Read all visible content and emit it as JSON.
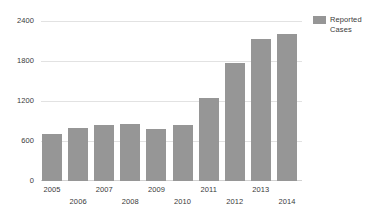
{
  "chart_data": {
    "type": "bar",
    "title": "",
    "xlabel": "",
    "ylabel": "",
    "categories": [
      "2005",
      "2006",
      "2007",
      "2008",
      "2009",
      "2010",
      "2011",
      "2012",
      "2013",
      "2014"
    ],
    "values": [
      700,
      790,
      840,
      860,
      780,
      840,
      1240,
      1770,
      2130,
      2200
    ],
    "series": [
      {
        "name": "Reported Cases",
        "values": [
          700,
          790,
          840,
          860,
          780,
          840,
          1240,
          1770,
          2130,
          2200
        ]
      }
    ],
    "ylim": [
      0,
      2400
    ],
    "y_ticks": [
      0,
      600,
      1200,
      1800,
      2400
    ],
    "y_tick_labels": [
      "0",
      "600",
      "1200",
      "1800",
      "2400"
    ],
    "grid": true,
    "legend_position": "top-right",
    "legend_entries": [
      "Reported Cases"
    ],
    "colors": {
      "bar": "#969696",
      "gridline": "#e2e2e2",
      "baseline": "#d2d2d2",
      "text": "#3a3a3a",
      "background": "#ffffff"
    },
    "x_label_rows": [
      0,
      1,
      0,
      1,
      0,
      1,
      0,
      1,
      0,
      1
    ]
  },
  "legend": {
    "label_line_1": "Reported",
    "label_line_2": "Cases"
  }
}
